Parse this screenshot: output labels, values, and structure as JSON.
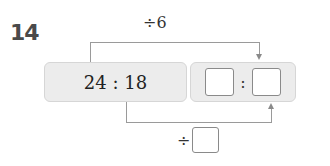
{
  "problem": {
    "number": "14",
    "top_operation": "÷6",
    "bottom_operation_symbol": "÷",
    "source_ratio": "24 : 18",
    "target_ratio": {
      "left_blank": "",
      "separator": ":",
      "right_blank": ""
    },
    "bottom_divisor_blank": ""
  }
}
